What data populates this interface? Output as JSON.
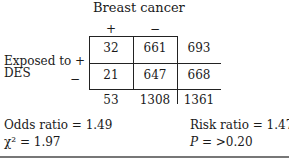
{
  "table": {
    "column_group_label": "Breast cancer",
    "column_headers": [
      "+",
      "−"
    ],
    "row_group_label_line1": "Exposed to",
    "row_group_label_line2": "DES",
    "row_headers": [
      "+",
      "−"
    ],
    "rows": [
      {
        "cells": [
          "32",
          "661"
        ],
        "total": "693"
      },
      {
        "cells": [
          "21",
          "647"
        ],
        "total": "668"
      }
    ],
    "column_totals": [
      "53",
      "1308"
    ],
    "grand_total": "1361"
  },
  "stats": {
    "odds_ratio": "Odds ratio = 1.49",
    "chi_square": "χ² = 1.97",
    "risk_ratio": "Risk ratio = 1.47",
    "p_value_label": "P",
    "p_value_rest": " = >0.20"
  }
}
